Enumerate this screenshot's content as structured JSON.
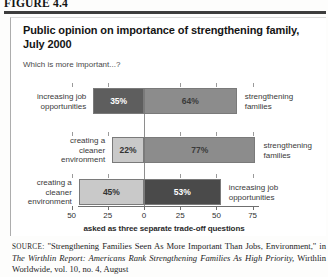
{
  "figure": {
    "label": "FIGURE 4.4"
  },
  "chart": {
    "title": "Public opinion on importance of strengthening family, July 2000",
    "subtitle": "Which is more important...?",
    "axis_caption": "asked as three separate trade-off questions"
  },
  "chart_data": {
    "type": "bar",
    "orientation": "horizontal-diverging",
    "title": "Public opinion on importance of strengthening family, July 2000",
    "subtitle": "Which is more important...?",
    "xlabel": "asked as three separate trade-off questions",
    "ylabel": "",
    "xlim": [
      -50,
      75
    ],
    "tick_labels": [
      "50",
      "25",
      "0",
      "25",
      "50",
      "75"
    ],
    "tick_values": [
      -50,
      -25,
      0,
      25,
      50,
      75
    ],
    "grid": false,
    "legend": "none",
    "zero_line": 0,
    "rows": [
      {
        "left_label": "increasing job opportunities",
        "right_label": "strengthening families",
        "left_value": 35,
        "left_value_label": "35%",
        "right_value": 64,
        "right_value_label": "64%",
        "left_color": "#5e5e5e",
        "right_color": "#8c8c8c"
      },
      {
        "left_label": "creating a cleaner environment",
        "right_label": "strengthening families",
        "left_value": 22,
        "left_value_label": "22%",
        "right_value": 77,
        "right_value_label": "77%",
        "left_color": "#c9c9c9",
        "right_color": "#8c8c8c"
      },
      {
        "left_label": "creating a cleaner environment",
        "right_label": "increasing job opportunities",
        "left_value": 45,
        "left_value_label": "45%",
        "right_value": 53,
        "right_value_label": "53%",
        "left_color": "#c9c9c9",
        "right_color": "#4a4a4a"
      }
    ]
  },
  "source": {
    "prefix": "SOURCE:",
    "text_1": " \"Strengthening Families Seen As More Important Than Jobs, Environment,\" in ",
    "italic_1": "The Wirthlin Report: Americans Rank Strengthening Families As High Priority,",
    "text_2": " Wirthlin Worldwide, vol. 10, no. 4, August"
  }
}
